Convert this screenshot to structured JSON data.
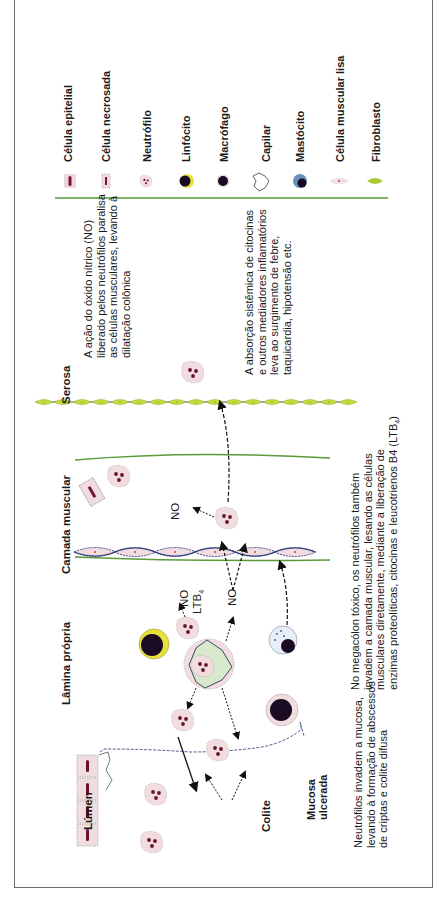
{
  "legend": {
    "items": [
      {
        "label": "Célula epitelial",
        "icon": "epithelial-cell-icon"
      },
      {
        "label": "Célula necrosada",
        "icon": "necrotic-cell-icon"
      },
      {
        "label": "Neutrófilo",
        "icon": "neutrophil-icon"
      },
      {
        "label": "Linfócito",
        "icon": "lymphocyte-icon"
      },
      {
        "label": "Macrófago",
        "icon": "macrophage-icon"
      },
      {
        "label": "Capilar",
        "icon": "capillary-icon"
      },
      {
        "label": "Mastócito",
        "icon": "mast-cell-icon"
      },
      {
        "label": "Célula muscular lisa",
        "icon": "smooth-muscle-cell-icon"
      },
      {
        "label": "Fibroblasto",
        "icon": "fibroblast-icon"
      }
    ],
    "divider_color": "#5a9a3a"
  },
  "layers": {
    "lumen": "Lúmen",
    "lamina_propria": "Lâmina própria",
    "muscular": "Camada muscular",
    "serosa": "Serosa",
    "colitis": "Colite",
    "ulcerated_mucosa": "Mucosa\nulcerada"
  },
  "mediators": {
    "no_1": "NO",
    "ltb4_label": "LTB",
    "ltb4_sub": "4",
    "no_2": "NO",
    "no_3": "NO"
  },
  "texts": {
    "no_action": "A ação do óxido nítrico (NO)\nliberado pelos neutrófilos paralisa\nas células musculares, levando à\ndilatação colônica",
    "systemic": "A absorção sistêmica de citocinas\ne outros mediadores inflamatórios\nleva ao surgimento de febre,\ntaquicardia, hipotensão etc.",
    "megacolon": "No megacólon tóxico, os neutrófilos também\ninvadem a camada muscular, lesando as células\nmusculares diretamente, mediante a liberação de\nenzimas proteolíticas, citocinas e leucotrienos B4 (LTB",
    "megacolon_sub": "4",
    "megacolon_end": ")",
    "neutrophils": "Neutrófilos invadem a mucosa,\nlevando à formação de abscessos\nde criptas e colite difusa"
  },
  "colors": {
    "cell_fill": "#f1dde0",
    "nucleus": "#5a1040",
    "muscle_line": "#2a3a7a",
    "green_line": "#5a9a3a",
    "serosa_fill": "#c8dc3c",
    "lymph_yellow": "#e6e23a",
    "macrophage_star": "#d8e8cc"
  }
}
